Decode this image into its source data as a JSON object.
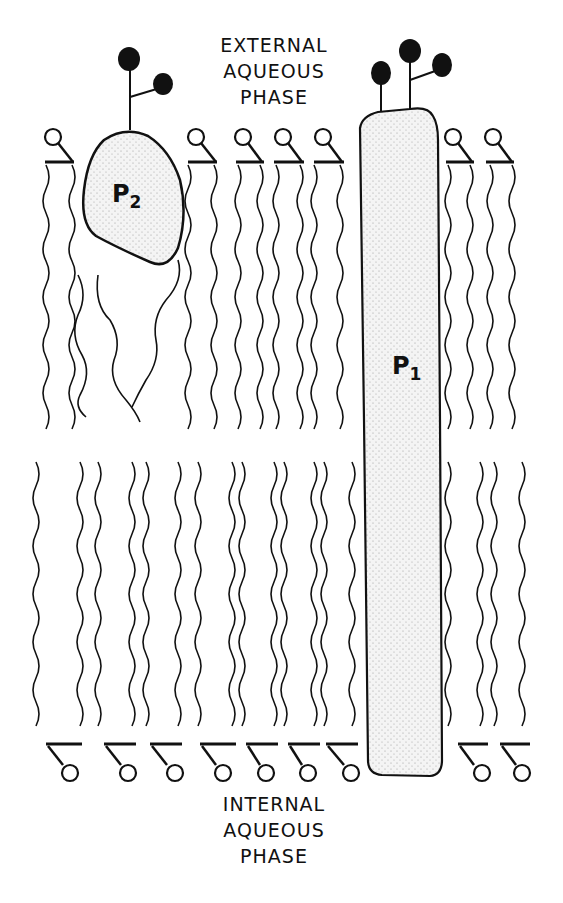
{
  "figure": {
    "external_label": [
      "EXTERNAL",
      "AQUEOUS",
      "PHASE"
    ],
    "internal_label": [
      "INTERNAL",
      "AQUEOUS",
      "PHASE"
    ],
    "proteins": [
      {
        "id": "P1",
        "letter": "P",
        "subscript": "1",
        "type": "integral transmembrane protein",
        "glycan_count": 3
      },
      {
        "id": "P2",
        "letter": "P",
        "subscript": "2",
        "type": "peripheral/partially embedded protein",
        "glycan_count": 2
      }
    ],
    "colors": {
      "ink": "#111111",
      "protein_fill": "#e6e6e6",
      "background": "#ffffff"
    },
    "outer_leaflet_lipids": 7,
    "inner_leaflet_lipids": 9
  }
}
